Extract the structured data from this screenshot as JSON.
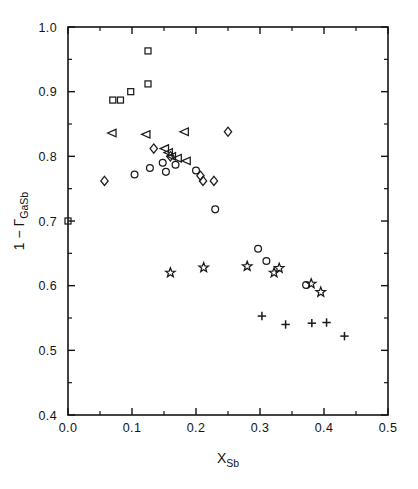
{
  "chart_data": {
    "type": "scatter",
    "title": "",
    "xlabel": "X",
    "xlabel_sub": "Sb",
    "ylabel_prefix": "1 − ",
    "ylabel_symbol": "Γ",
    "ylabel_sub": "GaSb",
    "xlim": [
      0.0,
      0.5
    ],
    "ylim": [
      0.4,
      1.0
    ],
    "xticks": [
      0.0,
      0.1,
      0.2,
      0.3,
      0.4,
      0.5
    ],
    "xticklabels": [
      "0.0",
      "0.1",
      "0.2",
      "0.3",
      "0.4",
      "0.5"
    ],
    "xticks_minor": [
      0.05,
      0.15,
      0.25,
      0.35,
      0.45
    ],
    "yticks": [
      0.4,
      0.5,
      0.6,
      0.7,
      0.8,
      0.9,
      1.0
    ],
    "yticklabels": [
      "0.4",
      "0.5",
      "0.6",
      "0.7",
      "0.8",
      "0.9",
      "1.0"
    ],
    "yticks_minor": [
      0.45,
      0.55,
      0.65,
      0.75,
      0.85,
      0.95
    ],
    "grid": false,
    "legend": "none",
    "marker_color": "#1a1a1a",
    "series": [
      {
        "name": "squares",
        "marker": "square",
        "points": [
          [
            0.0,
            0.7
          ],
          [
            0.07,
            0.887
          ],
          [
            0.082,
            0.887
          ],
          [
            0.098,
            0.9
          ],
          [
            0.125,
            0.963
          ],
          [
            0.125,
            0.912
          ]
        ]
      },
      {
        "name": "triangles-left",
        "marker": "triangle-left",
        "points": [
          [
            0.07,
            0.836
          ],
          [
            0.123,
            0.834
          ],
          [
            0.152,
            0.812
          ],
          [
            0.158,
            0.806
          ],
          [
            0.163,
            0.8
          ],
          [
            0.172,
            0.797
          ],
          [
            0.183,
            0.838
          ],
          [
            0.186,
            0.793
          ]
        ]
      },
      {
        "name": "circles",
        "marker": "circle",
        "points": [
          [
            0.104,
            0.772
          ],
          [
            0.128,
            0.782
          ],
          [
            0.148,
            0.79
          ],
          [
            0.153,
            0.776
          ],
          [
            0.168,
            0.787
          ],
          [
            0.2,
            0.778
          ],
          [
            0.23,
            0.718
          ],
          [
            0.297,
            0.657
          ],
          [
            0.31,
            0.638
          ],
          [
            0.372,
            0.601
          ]
        ]
      },
      {
        "name": "diamonds",
        "marker": "diamond",
        "points": [
          [
            0.057,
            0.762
          ],
          [
            0.134,
            0.812
          ],
          [
            0.16,
            0.8
          ],
          [
            0.207,
            0.77
          ],
          [
            0.211,
            0.762
          ],
          [
            0.228,
            0.762
          ],
          [
            0.25,
            0.838
          ]
        ]
      },
      {
        "name": "stars",
        "marker": "star",
        "points": [
          [
            0.16,
            0.62
          ],
          [
            0.212,
            0.628
          ],
          [
            0.28,
            0.63
          ],
          [
            0.322,
            0.62
          ],
          [
            0.33,
            0.627
          ],
          [
            0.38,
            0.603
          ],
          [
            0.395,
            0.59
          ]
        ]
      },
      {
        "name": "plus",
        "marker": "plus",
        "points": [
          [
            0.303,
            0.553
          ],
          [
            0.34,
            0.54
          ],
          [
            0.381,
            0.542
          ],
          [
            0.404,
            0.543
          ],
          [
            0.432,
            0.522
          ]
        ]
      }
    ]
  },
  "caption": {
    "text": ""
  }
}
